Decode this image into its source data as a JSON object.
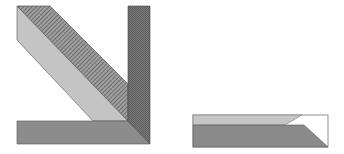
{
  "diagram": {
    "title": "",
    "figures": [
      {
        "name": "left-figure",
        "description": "Three-part assembly: diagonal light strip, diagonal hatched strip, vertical dark bar and horizontal bottom bar forming an L",
        "parts": [
          {
            "name": "diagonal-light-strip",
            "fill": "#c4c4c4"
          },
          {
            "name": "diagonal-hatched-strip",
            "fill": "#8a8a8a",
            "pattern": "diagonal-hatch"
          },
          {
            "name": "vertical-dark-bar",
            "fill": "#6e6e6e",
            "pattern": "fine-dither"
          },
          {
            "name": "horizontal-bottom-bar",
            "fill": "#8c8c8c"
          }
        ]
      },
      {
        "name": "right-figure",
        "description": "Rectangular box split into a light upper band and dark lower band, with a beveled right end",
        "parts": [
          {
            "name": "upper-light-band",
            "fill": "#c6c6c6"
          },
          {
            "name": "lower-dark-band",
            "fill": "#8a8a8a"
          },
          {
            "name": "white-notch",
            "fill": "#ffffff"
          }
        ]
      }
    ],
    "colors": {
      "outline": "#4a4a4a",
      "background": "#ffffff"
    }
  }
}
